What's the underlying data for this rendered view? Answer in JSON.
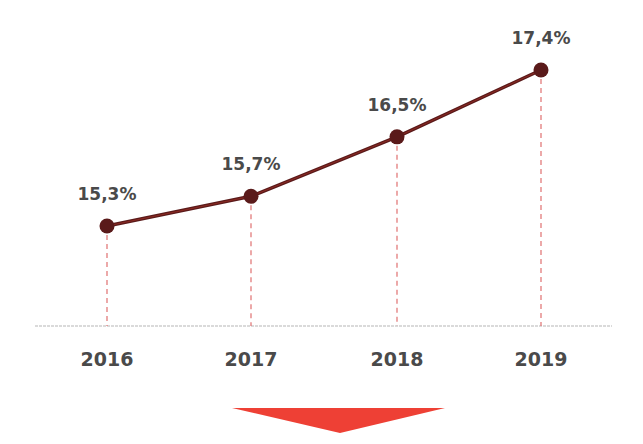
{
  "chart_data": {
    "type": "line",
    "title": "",
    "xlabel": "",
    "ylabel": "",
    "categories": [
      "2016",
      "2017",
      "2018",
      "2019"
    ],
    "values": [
      15.3,
      15.7,
      16.5,
      17.4
    ],
    "value_labels": [
      "15,3%",
      "15,7%",
      "16,5%",
      "17,4%"
    ],
    "unit": "%",
    "grid": false,
    "legend": null,
    "annotations": [
      "downward red arrow below chart"
    ],
    "colors": {
      "line": "#5a1a1a",
      "marker": "#5a1a1a",
      "drop_lines": "#e07070",
      "axis": "#b0b0b0",
      "arrow": "#ee4035",
      "text": "#4a4a4a"
    }
  }
}
